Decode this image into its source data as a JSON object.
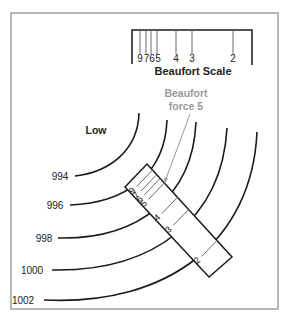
{
  "title": "Beaufort Scale",
  "low_label": "Low",
  "callout": {
    "line1": "Beaufort",
    "line2": "force 5"
  },
  "isobars": [
    {
      "label": "994"
    },
    {
      "label": "996"
    },
    {
      "label": "998"
    },
    {
      "label": "1000"
    },
    {
      "label": "1002"
    }
  ],
  "scale_ticks": [
    {
      "label": "9"
    },
    {
      "label": "7"
    },
    {
      "label": "6"
    },
    {
      "label": "5"
    },
    {
      "label": "4"
    },
    {
      "label": "3"
    },
    {
      "label": "2"
    }
  ],
  "rotated_scale_ticks": [
    {
      "label": "9"
    },
    {
      "label": "7"
    },
    {
      "label": "6"
    },
    {
      "label": "5"
    },
    {
      "label": "4"
    },
    {
      "label": "3"
    },
    {
      "label": "2"
    }
  ],
  "colors": {
    "line": "#1a1a1a",
    "tick": "#6a6a6a",
    "callout": "#9a9a9a",
    "frame": "#8a8a8a"
  }
}
